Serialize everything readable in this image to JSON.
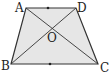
{
  "diagram": {
    "type": "trapezoid",
    "fill_color": "#e6e6e6",
    "stroke_color": "#333333",
    "vertices": {
      "A": {
        "label": "A",
        "x": 26,
        "y": 8
      },
      "D": {
        "label": "D",
        "x": 76,
        "y": 8
      },
      "B": {
        "label": "B",
        "x": 11,
        "y": 64
      },
      "C": {
        "label": "C",
        "x": 98,
        "y": 64
      }
    },
    "intersection": {
      "label": "O",
      "x": 51,
      "y": 28
    },
    "diagonals": [
      "AC",
      "BD"
    ],
    "midpoint_marks": [
      "AD",
      "BC"
    ]
  }
}
